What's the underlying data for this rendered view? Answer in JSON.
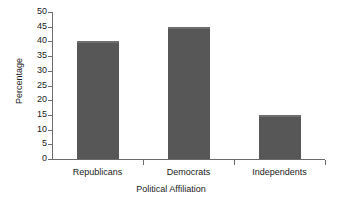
{
  "chart_data": {
    "type": "bar",
    "title": "",
    "subtitle": "",
    "xlabel": "Political Affiliation",
    "ylabel": "Percentage",
    "categories": [
      "Republicans",
      "Democrats",
      "Independents"
    ],
    "values": [
      40,
      45,
      15
    ],
    "ylim": [
      0,
      50
    ],
    "yticks": [
      0,
      5,
      10,
      15,
      20,
      25,
      30,
      35,
      40,
      45,
      50
    ],
    "ytick_labels": [
      "0",
      "5",
      "10",
      "15",
      "20",
      "25",
      "30",
      "35",
      "40",
      "45",
      "50"
    ],
    "grid": false,
    "legend": null,
    "legend_position": "none",
    "bar_color": "#575757",
    "bar_top_highlight_color": "#6e6e6e",
    "axis_color": "#6b6b6b",
    "background_color": "#ffffff",
    "text_color": "#1a1a1a",
    "annotations": []
  },
  "axes": {
    "y_title": "Percentage",
    "x_title": "Political Affiliation"
  }
}
